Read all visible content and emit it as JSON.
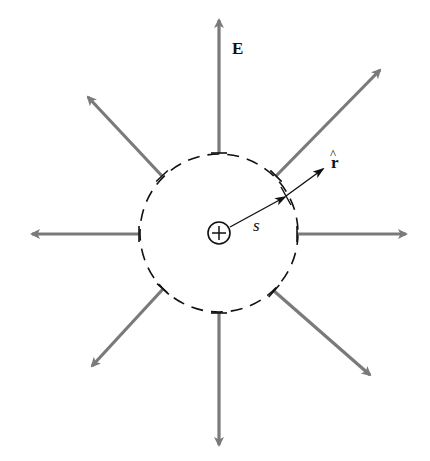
{
  "diagram": {
    "colors": {
      "field_line": "#7a7a7a",
      "ink": "#111111",
      "background": "#ffffff"
    },
    "center": [
      219,
      233
    ],
    "gaussian_surface": {
      "radius": 79,
      "style": "dashed"
    },
    "charge": {
      "symbol": "+",
      "radius": 11,
      "label": "positive point charge"
    },
    "field_arrows": [
      {
        "name": "up",
        "angle_deg": -90,
        "start": [
          219,
          153
        ],
        "end": [
          219,
          20
        ]
      },
      {
        "name": "up-right",
        "angle_deg": -45,
        "start": [
          276,
          176
        ],
        "end": [
          380,
          70
        ]
      },
      {
        "name": "right",
        "angle_deg": 0,
        "start": [
          297,
          234
        ],
        "end": [
          406,
          234
        ]
      },
      {
        "name": "down-right",
        "angle_deg": 45,
        "start": [
          274,
          291
        ],
        "end": [
          370,
          375
        ]
      },
      {
        "name": "down",
        "angle_deg": 90,
        "start": [
          219,
          313
        ],
        "end": [
          219,
          445
        ]
      },
      {
        "name": "down-left",
        "angle_deg": 135,
        "start": [
          163,
          289
        ],
        "end": [
          92,
          366
        ]
      },
      {
        "name": "left",
        "angle_deg": 180,
        "start": [
          139,
          234
        ],
        "end": [
          32,
          234
        ]
      },
      {
        "name": "up-left",
        "angle_deg": -135,
        "start": [
          162,
          176
        ],
        "end": [
          88,
          97
        ]
      }
    ],
    "radial_vector": {
      "start": [
        230,
        227
      ],
      "tick": [
        286,
        196
      ],
      "end": [
        325,
        168
      ]
    },
    "labels": {
      "field": "E",
      "radius": "s",
      "unit_vector": "r",
      "unit_vector_hat": "^"
    }
  }
}
